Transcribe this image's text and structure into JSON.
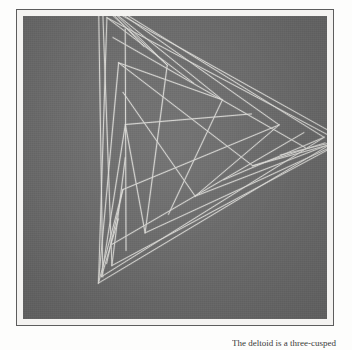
{
  "page": {
    "background_color": "#fdfdfc"
  },
  "plate": {
    "name": "deltoid-line-envelope-plate",
    "frame_color": "#5d5d5d",
    "mat_color": "#f4f3f1",
    "photo_background_color": "#6c6c6c",
    "line_color": "#e8e7e2",
    "subject": "deltoid",
    "alt_names": [
      "tricuspoid",
      "Steiner curve"
    ],
    "cusp_count": 3,
    "construction": "envelope of straight line segments (tangent lines)",
    "cusps": [
      {
        "label": "left-cusp",
        "x": 14,
        "y": 42
      },
      {
        "label": "right-cusp",
        "x": 304,
        "y": 42
      },
      {
        "label": "bottom-cusp",
        "x": 159,
        "y": 291
      }
    ],
    "line_counts": {
      "left_fan": 14,
      "right_fan": 14,
      "bottom_fan": 14
    }
  },
  "caption": {
    "text": "The deltoid is a three-cusped"
  }
}
